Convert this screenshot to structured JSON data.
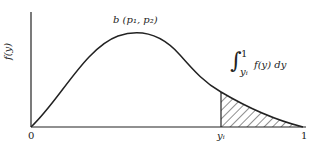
{
  "diagram": {
    "type": "beta-density-tail-area",
    "y_axis_label": "f(y)",
    "curve_label": "b (p₁, p₂)",
    "integral": {
      "sign": "∫",
      "upper": "1",
      "lower": "yᵢ",
      "integrand": "f(y) dy"
    },
    "x_tick_labels": {
      "origin": "0",
      "yi": "yᵢ",
      "end": "1"
    },
    "shaded_region": "area under curve from yᵢ to 1",
    "colors": {
      "line": "#222222",
      "background": "#ffffff"
    }
  }
}
